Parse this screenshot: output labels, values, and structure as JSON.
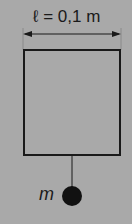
{
  "diagram": {
    "dimension_label": "ℓ = 0,1 m",
    "mass_label": "m",
    "colors": {
      "background": "#a9a9a9",
      "stroke": "#1a1a1a",
      "mass": "#111111"
    }
  }
}
